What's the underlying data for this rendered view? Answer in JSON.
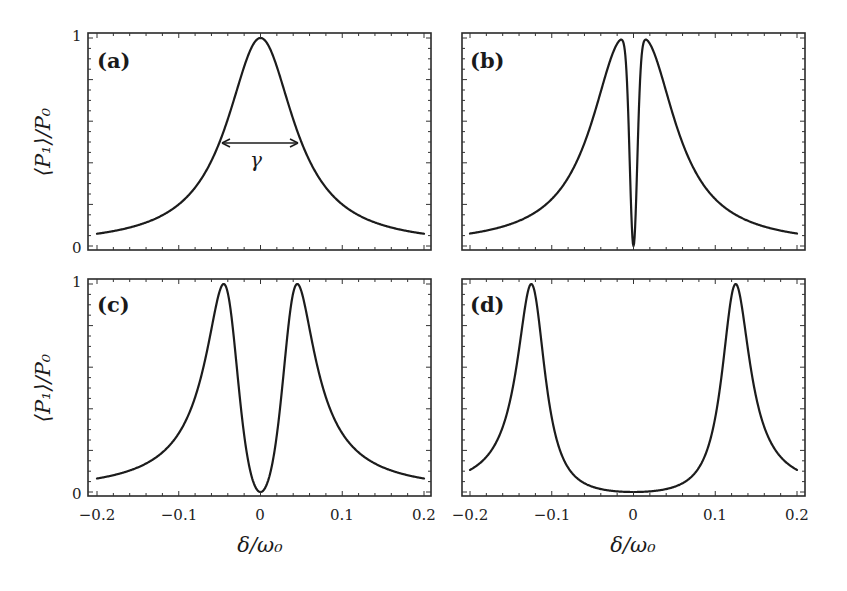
{
  "figure": {
    "ylabel": "⟨P₁⟩/P₀",
    "xlabel": "δ/ω₀",
    "annotation": "γ",
    "panels": [
      {
        "id": "a",
        "label": "(a)"
      },
      {
        "id": "b",
        "label": "(b)"
      },
      {
        "id": "c",
        "label": "(c)"
      },
      {
        "id": "d",
        "label": "(d)"
      }
    ],
    "x_ticks": [
      "−0.2",
      "−0.1",
      "0",
      "0.1",
      "0.2"
    ],
    "y_ticks": [
      "0",
      "1"
    ]
  },
  "chart_data": [
    {
      "type": "line",
      "title": "(a)",
      "xlabel": "δ/ω₀",
      "ylabel": "⟨P₁⟩/P₀",
      "xlim": [
        -0.2,
        0.2
      ],
      "ylim": [
        0,
        1
      ],
      "annotation": {
        "text": "γ",
        "kind": "double-arrow FWHM",
        "x_from": -0.05,
        "x_to": 0.05,
        "y": 0.5
      },
      "series": [
        {
          "name": "single Lorentzian",
          "center": 0.0,
          "peak": 1.0,
          "x": [
            -0.2,
            -0.15,
            -0.1,
            -0.075,
            -0.05,
            -0.025,
            0,
            0.025,
            0.05,
            0.075,
            0.1,
            0.15,
            0.2
          ],
          "y": [
            0.06,
            0.1,
            0.2,
            0.31,
            0.5,
            0.8,
            1.0,
            0.8,
            0.5,
            0.31,
            0.2,
            0.1,
            0.06
          ]
        }
      ]
    },
    {
      "type": "line",
      "title": "(b)",
      "xlabel": "δ/ω₀",
      "ylabel": "⟨P₁⟩/P₀",
      "xlim": [
        -0.2,
        0.2
      ],
      "ylim": [
        0,
        1
      ],
      "series": [
        {
          "name": "split peaks, narrow dip",
          "peaks": [
            -0.012,
            0.012
          ],
          "dip_at": 0.0,
          "dip_value": 0.0,
          "x": [
            -0.2,
            -0.15,
            -0.1,
            -0.05,
            -0.025,
            -0.012,
            -0.005,
            0,
            0.005,
            0.012,
            0.025,
            0.05,
            0.1,
            0.15,
            0.2
          ],
          "y": [
            0.06,
            0.1,
            0.2,
            0.48,
            0.85,
            1.0,
            0.5,
            0.0,
            0.5,
            1.0,
            0.85,
            0.48,
            0.2,
            0.1,
            0.06
          ]
        }
      ]
    },
    {
      "type": "line",
      "title": "(c)",
      "xlabel": "δ/ω₀",
      "ylabel": "⟨P₁⟩/P₀",
      "xlim": [
        -0.2,
        0.2
      ],
      "ylim": [
        0,
        1
      ],
      "series": [
        {
          "name": "split peaks, wider dip",
          "peaks": [
            -0.045,
            0.045
          ],
          "dip_at": 0.0,
          "dip_value": 0.0,
          "x": [
            -0.2,
            -0.15,
            -0.1,
            -0.07,
            -0.045,
            -0.025,
            0,
            0.025,
            0.045,
            0.07,
            0.1,
            0.15,
            0.2
          ],
          "y": [
            0.08,
            0.14,
            0.3,
            0.6,
            1.0,
            0.55,
            0.0,
            0.55,
            1.0,
            0.6,
            0.3,
            0.14,
            0.08
          ]
        }
      ]
    },
    {
      "type": "line",
      "title": "(d)",
      "xlabel": "δ/ω₀",
      "ylabel": "⟨P₁⟩/P₀",
      "xlim": [
        -0.2,
        0.2
      ],
      "ylim": [
        0,
        1
      ],
      "series": [
        {
          "name": "well-separated peaks",
          "peaks": [
            -0.125,
            0.125
          ],
          "dip_at": 0.0,
          "dip_value": 0.0,
          "x": [
            -0.2,
            -0.15,
            -0.125,
            -0.1,
            -0.075,
            -0.05,
            0,
            0.05,
            0.075,
            0.1,
            0.125,
            0.15,
            0.2
          ],
          "y": [
            0.16,
            0.55,
            1.0,
            0.45,
            0.15,
            0.05,
            0.0,
            0.05,
            0.15,
            0.45,
            1.0,
            0.55,
            0.16
          ]
        }
      ]
    }
  ]
}
